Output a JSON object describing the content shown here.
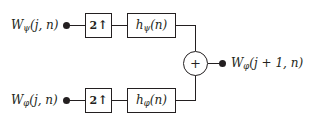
{
  "diagram": {
    "type": "signal-flow-block-diagram",
    "line_color": "#231f20",
    "background_color": "#ffffff",
    "inputs": [
      {
        "id": "detail-input",
        "label_base": "W",
        "label_subscript": "ψ",
        "label_args": "(j, n)",
        "row": "top"
      },
      {
        "id": "approximation-input",
        "label_base": "W",
        "label_subscript": "φ",
        "label_args": "(j, n)",
        "row": "bottom"
      }
    ],
    "upsamplers": [
      {
        "id": "upsampler-top",
        "factor": "2",
        "arrow": "↑",
        "row": "top"
      },
      {
        "id": "upsampler-bottom",
        "factor": "2",
        "arrow": "↑",
        "row": "bottom"
      }
    ],
    "filters": [
      {
        "id": "filter-psi",
        "label_base": "h",
        "label_subscript": "ψ",
        "label_args": "(n)",
        "row": "top"
      },
      {
        "id": "filter-phi",
        "label_base": "h",
        "label_subscript": "φ",
        "label_args": "(n)",
        "row": "bottom"
      }
    ],
    "summer": {
      "id": "summing-junction",
      "operator": "+"
    },
    "output": {
      "id": "reconstructed-output",
      "label_base": "W",
      "label_subscript": "φ",
      "label_args": "(j + 1, n)"
    }
  }
}
